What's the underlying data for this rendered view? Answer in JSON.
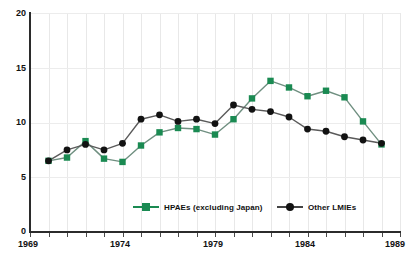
{
  "chart_data": {
    "type": "line",
    "title": "",
    "xlabel": "",
    "ylabel": "",
    "xlim": [
      1969,
      1989
    ],
    "ylim": [
      0,
      20
    ],
    "yticks": [
      0,
      5,
      10,
      15,
      20
    ],
    "xticks": [
      1969,
      1974,
      1979,
      1984,
      1989
    ],
    "xtick_labels": [
      "1969",
      "1974",
      "1979",
      "1984",
      "1989"
    ],
    "ytick_labels": [
      "0",
      "5",
      "10",
      "15",
      "20"
    ],
    "grid": true,
    "legend_position": "lower center",
    "x": [
      1970,
      1971,
      1972,
      1973,
      1974,
      1975,
      1976,
      1977,
      1978,
      1979,
      1980,
      1981,
      1982,
      1983,
      1984,
      1985,
      1986,
      1987,
      1988
    ],
    "series": [
      {
        "name": "HPAEs (excluding Japan)",
        "color": "#1a8a52",
        "marker": "square",
        "values": [
          6.5,
          6.8,
          8.3,
          6.7,
          6.4,
          7.9,
          9.1,
          9.5,
          9.4,
          8.9,
          10.3,
          12.2,
          13.8,
          13.2,
          12.4,
          12.9,
          12.3,
          10.1,
          8.0
        ]
      },
      {
        "name": "Other LMIEs",
        "color": "#121212",
        "marker": "circle",
        "values": [
          6.5,
          7.5,
          8.0,
          7.5,
          8.1,
          10.3,
          10.7,
          10.1,
          10.3,
          9.9,
          11.6,
          11.2,
          11.0,
          10.5,
          9.4,
          9.2,
          8.7,
          8.4,
          8.1
        ]
      }
    ]
  },
  "legend": {
    "entries": [
      {
        "label": "HPAEs (excluding Japan)",
        "color": "#1a8a52",
        "marker": "square"
      },
      {
        "label": "Other LMIEs",
        "color": "#121212",
        "marker": "circle"
      }
    ]
  },
  "axes": {
    "y_label_0": "0",
    "y_label_5": "5",
    "y_label_10": "10",
    "y_label_15": "15",
    "y_label_20": "20",
    "x_label_1969": "1969",
    "x_label_1974": "1974",
    "x_label_1979": "1979",
    "x_label_1984": "1984",
    "x_label_1989": "1989"
  },
  "title_text": ""
}
